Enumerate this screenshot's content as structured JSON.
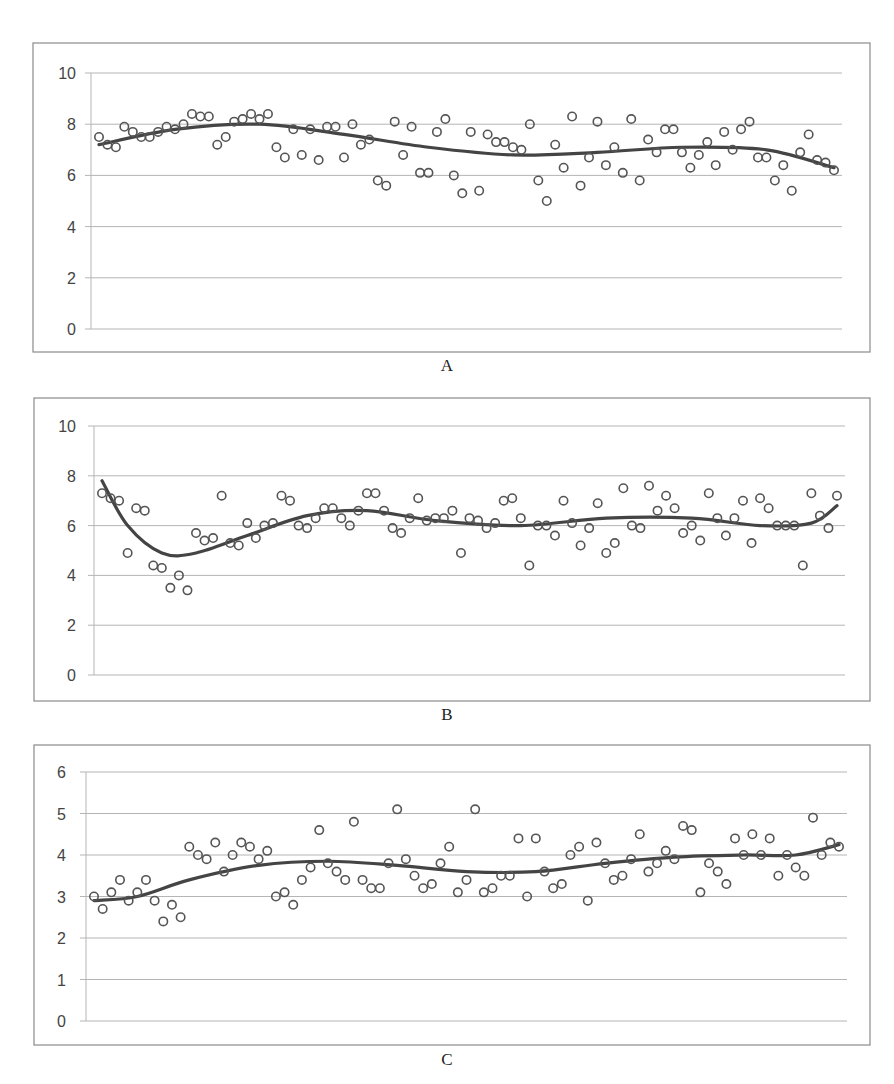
{
  "figure": {
    "panels": [
      {
        "caption": "A"
      },
      {
        "caption": "B"
      },
      {
        "caption": "C"
      }
    ]
  },
  "colors": {
    "frame": "#8a8a8a",
    "grid": "#b5b5b5",
    "marker": "#555555",
    "trend": "#444444",
    "tick_text": "#444444"
  },
  "chart_data": [
    {
      "type": "scatter",
      "title": "",
      "caption": "A",
      "xlabel": "",
      "ylabel": "",
      "ylim": [
        0,
        10
      ],
      "yticks": [
        0,
        2,
        4,
        6,
        8,
        10
      ],
      "xlim": [
        1,
        100
      ],
      "grid": true,
      "legend": "none",
      "series": [
        {
          "name": "observations",
          "marker": "open-circle",
          "values": [
            7.5,
            7.2,
            7.1,
            7.9,
            7.7,
            7.5,
            7.5,
            7.7,
            7.9,
            7.8,
            8.0,
            8.4,
            8.3,
            8.3,
            7.2,
            7.5,
            8.1,
            8.2,
            8.4,
            8.2,
            8.4,
            7.1,
            6.7,
            7.8,
            6.8,
            7.8,
            6.6,
            7.9,
            7.9,
            6.7,
            8.0,
            7.2,
            7.4,
            5.8,
            5.6,
            8.1,
            6.8,
            7.9,
            6.1,
            6.1,
            7.7,
            8.2,
            6.0,
            5.3,
            7.7,
            5.4,
            7.6,
            7.3,
            7.3,
            7.1,
            7.0,
            8.0,
            5.8,
            5.0,
            7.2,
            6.3,
            8.3,
            5.6,
            6.7,
            8.1,
            6.4,
            7.1,
            6.1,
            8.2,
            5.8,
            7.4,
            6.9,
            7.8,
            7.8,
            6.9,
            6.3,
            6.8,
            7.3,
            6.4,
            7.7,
            7.0,
            7.8,
            8.1,
            6.7,
            6.7,
            5.8,
            6.4,
            5.4,
            6.9,
            7.6,
            6.6,
            6.5,
            6.2
          ]
        },
        {
          "name": "trend",
          "type": "line",
          "x": [
            1,
            10,
            20,
            30,
            40,
            50,
            60,
            70,
            80,
            88
          ],
          "values": [
            7.2,
            7.8,
            8.0,
            7.6,
            7.1,
            6.8,
            6.9,
            7.1,
            7.0,
            6.3
          ]
        }
      ]
    },
    {
      "type": "scatter",
      "title": "",
      "caption": "B",
      "xlabel": "",
      "ylabel": "",
      "ylim": [
        0,
        10
      ],
      "yticks": [
        0,
        2,
        4,
        6,
        8,
        10
      ],
      "grid": true,
      "legend": "none",
      "series": [
        {
          "name": "observations",
          "marker": "open-circle",
          "values": [
            7.3,
            7.1,
            7.0,
            4.9,
            6.7,
            6.6,
            4.4,
            4.3,
            3.5,
            4.0,
            3.4,
            5.7,
            5.4,
            5.5,
            7.2,
            5.3,
            5.2,
            6.1,
            5.5,
            6.0,
            6.1,
            7.2,
            7.0,
            6.0,
            5.9,
            6.3,
            6.7,
            6.7,
            6.3,
            6.0,
            6.6,
            7.3,
            7.3,
            6.6,
            5.9,
            5.7,
            6.3,
            7.1,
            6.2,
            6.3,
            6.3,
            6.6,
            4.9,
            6.3,
            6.2,
            5.9,
            6.1,
            7.0,
            7.1,
            6.3,
            4.4,
            6.0,
            6.0,
            5.6,
            7.0,
            6.1,
            5.2,
            5.9,
            6.9,
            4.9,
            5.3,
            7.5,
            6.0,
            5.9,
            7.6,
            6.6,
            7.2,
            6.7,
            5.7,
            6.0,
            5.4,
            7.3,
            6.3,
            5.6,
            6.3,
            7.0,
            5.3,
            7.1,
            6.7,
            6.0,
            6.0,
            6.0,
            4.4,
            7.3,
            6.4,
            5.9,
            7.2
          ]
        },
        {
          "name": "trend",
          "type": "line",
          "x": [
            1,
            4,
            8,
            12,
            18,
            25,
            32,
            40,
            50,
            60,
            70,
            78,
            84,
            87
          ],
          "values": [
            7.8,
            6.0,
            4.9,
            4.9,
            5.6,
            6.4,
            6.6,
            6.2,
            6.0,
            6.3,
            6.3,
            6.0,
            6.1,
            6.8
          ]
        }
      ]
    },
    {
      "type": "scatter",
      "title": "",
      "caption": "C",
      "xlabel": "",
      "ylabel": "",
      "ylim": [
        0,
        6
      ],
      "yticks": [
        0,
        1,
        2,
        3,
        4,
        5,
        6
      ],
      "grid": true,
      "legend": "none",
      "series": [
        {
          "name": "observations",
          "marker": "open-circle",
          "values": [
            3.0,
            2.7,
            3.1,
            3.4,
            2.9,
            3.1,
            3.4,
            2.9,
            2.4,
            2.8,
            2.5,
            4.2,
            4.0,
            3.9,
            4.3,
            3.6,
            4.0,
            4.3,
            4.2,
            3.9,
            4.1,
            3.0,
            3.1,
            2.8,
            3.4,
            3.7,
            4.6,
            3.8,
            3.6,
            3.4,
            4.8,
            3.4,
            3.2,
            3.2,
            3.8,
            5.1,
            3.9,
            3.5,
            3.2,
            3.3,
            3.8,
            4.2,
            3.1,
            3.4,
            5.1,
            3.1,
            3.2,
            3.5,
            3.5,
            4.4,
            3.0,
            4.4,
            3.6,
            3.2,
            3.3,
            4.0,
            4.2,
            2.9,
            4.3,
            3.8,
            3.4,
            3.5,
            3.9,
            4.5,
            3.6,
            3.8,
            4.1,
            3.9,
            4.7,
            4.6,
            3.1,
            3.8,
            3.6,
            3.3,
            4.4,
            4.0,
            4.5,
            4.0,
            4.4,
            3.5,
            4.0,
            3.7,
            3.5,
            4.9,
            4.0,
            4.3,
            4.2
          ]
        },
        {
          "name": "trend",
          "type": "line",
          "x": [
            1,
            6,
            12,
            20,
            28,
            36,
            44,
            52,
            60,
            68,
            76,
            82,
            87
          ],
          "values": [
            2.9,
            3.0,
            3.4,
            3.75,
            3.85,
            3.75,
            3.6,
            3.6,
            3.8,
            3.95,
            4.0,
            4.0,
            4.25
          ]
        }
      ]
    }
  ]
}
